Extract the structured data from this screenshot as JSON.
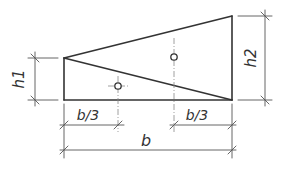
{
  "diagram": {
    "type": "trapezoid-section-split-into-two-triangles",
    "labels": {
      "h1": "h1",
      "h2": "h2",
      "b_third_left": "b/3",
      "b_third_right": "b/3",
      "b": "b"
    },
    "colors": {
      "outline": "#333333",
      "dimension": "#555555",
      "axis": "#888888"
    }
  }
}
